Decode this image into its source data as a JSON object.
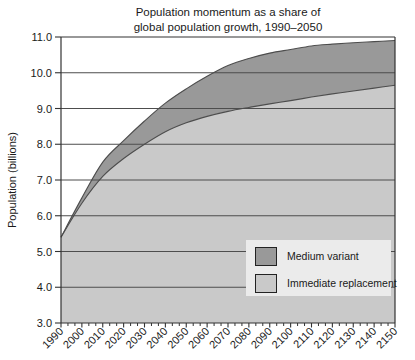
{
  "title": {
    "line1": "Population momentum as a share of",
    "line2": "global population growth, 1990–2050"
  },
  "chart_data": {
    "type": "area",
    "x": [
      1990,
      2000,
      2010,
      2020,
      2030,
      2040,
      2050,
      2060,
      2070,
      2080,
      2090,
      2100,
      2110,
      2120,
      2130,
      2140,
      2150
    ],
    "series": [
      {
        "name": "Medium variant",
        "color": "#999999",
        "values": [
          5.4,
          6.5,
          7.5,
          8.1,
          8.65,
          9.15,
          9.55,
          9.9,
          10.2,
          10.4,
          10.55,
          10.65,
          10.75,
          10.8,
          10.84,
          10.87,
          10.9
        ]
      },
      {
        "name": "Immediate replacement",
        "color": "#c9c9c9",
        "values": [
          5.4,
          6.35,
          7.1,
          7.6,
          8.0,
          8.35,
          8.6,
          8.78,
          8.92,
          9.03,
          9.13,
          9.22,
          9.32,
          9.41,
          9.49,
          9.57,
          9.65
        ]
      }
    ],
    "xlabel": "",
    "ylabel": "Population (billions)",
    "ylim": [
      3.0,
      11.0
    ],
    "ytick_step": 1.0,
    "ytick_labels": [
      "3.0",
      "4.0",
      "5.0",
      "6.0",
      "7.0",
      "8.0",
      "9.0",
      "10.0",
      "11.0"
    ],
    "grid": true,
    "legend_position": "inside-right-center",
    "colors": {
      "grid_line": "#4d4d4d",
      "axis_line": "#333333",
      "curve_outline": "#4d4d4d",
      "legend_background": "#ebebeb",
      "text": "#1a1a1a"
    }
  }
}
